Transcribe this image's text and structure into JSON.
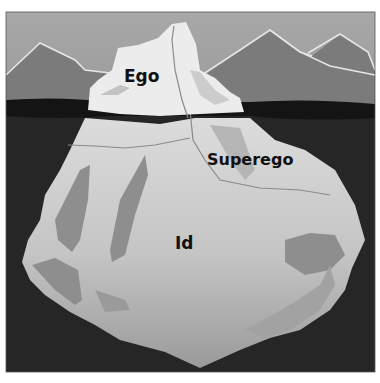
{
  "diagram": {
    "type": "iceberg-metaphor",
    "labels": {
      "ego": "Ego",
      "superego": "Superego",
      "id": "Id"
    },
    "colors": {
      "sky": "#a3a3a3",
      "mountains": "#7b7b7b",
      "mountain_outline": "#e6e6e6",
      "waterline": "#1a1a1a",
      "deep_water": "#262626",
      "iceberg_top": "#ececec",
      "iceberg_underwater": "#c9c9c9",
      "iceberg_shadow": "#8a8a8a",
      "text": "#111111"
    }
  }
}
